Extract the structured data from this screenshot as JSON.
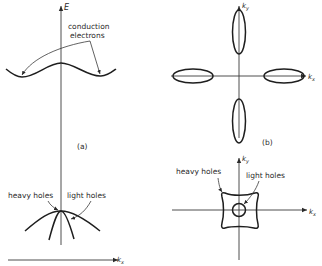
{
  "figure": {
    "panel_a": {
      "label": "(a)",
      "top": {
        "axis_label": "E",
        "annotation": [
          "conduction",
          "electrons"
        ]
      },
      "bottom": {
        "axis_label": "k",
        "axis_subscript": "x",
        "annotations": {
          "heavy": "heavy holes",
          "light": "light holes"
        }
      }
    },
    "panel_b": {
      "label": "(b)",
      "top": {
        "x_axis_label": "k",
        "x_axis_subscript": "x",
        "y_axis_label": "k",
        "y_axis_subscript": "y"
      },
      "bottom": {
        "x_axis_label": "k",
        "x_axis_subscript": "x",
        "y_axis_label": "k",
        "y_axis_subscript": "y",
        "annotations": {
          "heavy": "heavy holes",
          "light": "light holes"
        }
      }
    }
  }
}
